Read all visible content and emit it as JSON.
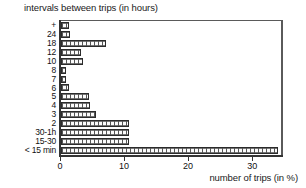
{
  "chart_data": {
    "type": "bar",
    "orientation": "horizontal",
    "title": "intervals between trips (in hours)",
    "xlabel": "number of trips (in %)",
    "ylabel": "",
    "xlim": [
      0,
      34.5
    ],
    "ylim": null,
    "grid": false,
    "legend": null,
    "xticks": [
      0,
      10,
      20,
      30
    ],
    "xtick_labels": [
      "0",
      "10",
      "20",
      "30"
    ],
    "categories": [
      "+",
      "24",
      "18",
      "12",
      "10",
      "8",
      "7",
      "6",
      "5",
      "4",
      "3",
      "2",
      "30-1h",
      "15-30",
      "< 15 min"
    ],
    "values": [
      1.2,
      1.4,
      7.0,
      3.1,
      3.4,
      0.7,
      0.7,
      1.2,
      4.3,
      4.5,
      5.4,
      10.6,
      10.6,
      10.6,
      33.9
    ],
    "bars": [
      {
        "label": "+",
        "value": 1.2
      },
      {
        "label": "24",
        "value": 1.4
      },
      {
        "label": "18",
        "value": 7.0
      },
      {
        "label": "12",
        "value": 3.1
      },
      {
        "label": "10",
        "value": 3.4
      },
      {
        "label": "8",
        "value": 0.7
      },
      {
        "label": "7",
        "value": 0.7
      },
      {
        "label": "6",
        "value": 1.2
      },
      {
        "label": "5",
        "value": 4.3
      },
      {
        "label": "4",
        "value": 4.5
      },
      {
        "label": "3",
        "value": 5.4
      },
      {
        "label": "2",
        "value": 10.6
      },
      {
        "label": "30-1h",
        "value": 10.6
      },
      {
        "label": "15-30",
        "value": 10.6
      },
      {
        "label": "< 15 min",
        "value": 33.9
      }
    ],
    "colors": {
      "bar_fill": "#fbfbfb",
      "bar_pattern": "#555555",
      "bar_border": "#2b2b2b",
      "axis": "#333333",
      "frame": "#5a5a5a",
      "text": "#111111",
      "background": "#ffffff"
    }
  }
}
